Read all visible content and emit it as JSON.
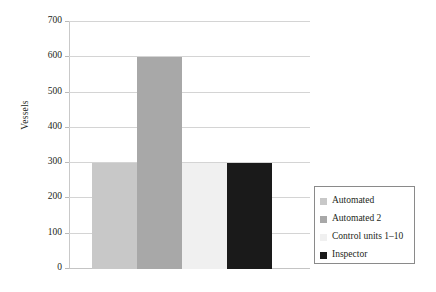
{
  "chart_data": {
    "type": "bar",
    "title": "",
    "subtitle": "",
    "xlabel": "",
    "ylabel": "Vessels",
    "ylim": [
      0,
      700
    ],
    "ytick_labels": [
      "0",
      "100",
      "200",
      "300",
      "400",
      "500",
      "600",
      "700"
    ],
    "ytick_values": [
      0,
      100,
      200,
      300,
      400,
      500,
      600,
      700
    ],
    "xtick_labels": [],
    "grid": "horizontal",
    "legend_position": "right",
    "categories": [
      "Automated",
      "Automated 2",
      "Control units 1–10",
      "Inspector"
    ],
    "values": [
      300,
      600,
      300,
      300
    ],
    "series": [
      {
        "name": "Vessels",
        "values": [
          300,
          600,
          300,
          300
        ]
      }
    ],
    "bar_colors": [
      "#c8c8c8",
      "#a8a8a8",
      "#f0f0f0",
      "#1a1a1a"
    ],
    "annotations": []
  },
  "axes": {
    "y_title": "Vessels"
  },
  "legend": {
    "items": [
      {
        "label": "Automated",
        "color": "#c8c8c8"
      },
      {
        "label": "Automated 2",
        "color": "#a8a8a8"
      },
      {
        "label": "Control units 1–10",
        "color": "#f0f0f0"
      },
      {
        "label": "Inspector",
        "color": "#1a1a1a"
      }
    ]
  },
  "colors": {
    "background": "#ffffff",
    "gridline": "#d4d4d4",
    "axis": "#c9c9c9",
    "text": "#231f20",
    "legend_border": "#8a8a8a"
  }
}
